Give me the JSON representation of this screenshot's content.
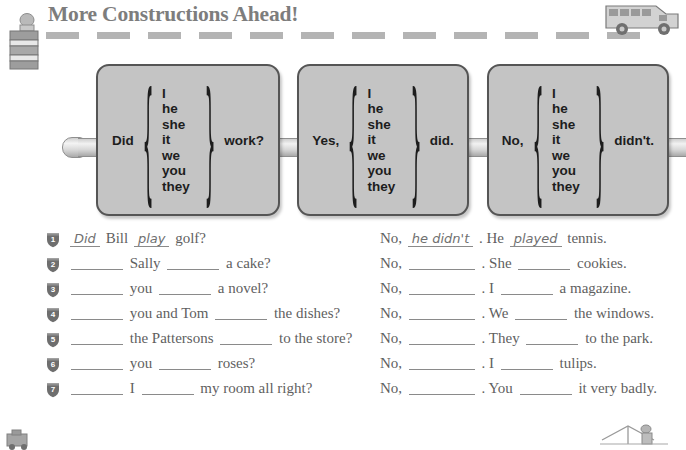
{
  "header": {
    "title": "More Constructions Ahead!",
    "barrel_icon": "construction-barrel-icon",
    "bus_icon": "school-bus-icon",
    "divider": "road-dash-divider",
    "dash_count": 12
  },
  "grammar_boxes": [
    {
      "lead": "Did",
      "pronouns": [
        "I",
        "he",
        "she",
        "it",
        "we",
        "you",
        "they"
      ],
      "tail": "work?"
    },
    {
      "lead": "Yes,",
      "pronouns": [
        "I",
        "he",
        "she",
        "it",
        "we",
        "you",
        "they"
      ],
      "tail": "did."
    },
    {
      "lead": "No,",
      "pronouns": [
        "I",
        "he",
        "she",
        "it",
        "we",
        "you",
        "they"
      ],
      "tail": "didn't."
    }
  ],
  "exercises": [
    {
      "number": "1",
      "left": [
        {
          "type": "answer",
          "text": "Did"
        },
        {
          "type": "text",
          "text": "Bill"
        },
        {
          "type": "answer",
          "text": "play"
        },
        {
          "type": "text",
          "text": "golf?"
        }
      ],
      "right": [
        {
          "type": "text",
          "text": "No,"
        },
        {
          "type": "answer",
          "text": "he didn't"
        },
        {
          "type": "text",
          "text": ". He"
        },
        {
          "type": "answer",
          "text": "played"
        },
        {
          "type": "text",
          "text": "tennis."
        }
      ]
    },
    {
      "number": "2",
      "left": [
        {
          "type": "blank",
          "size": "b-md"
        },
        {
          "type": "text",
          "text": "Sally"
        },
        {
          "type": "blank",
          "size": "b-md"
        },
        {
          "type": "text",
          "text": "a cake?"
        }
      ],
      "right": [
        {
          "type": "text",
          "text": "No,"
        },
        {
          "type": "blank",
          "size": "b-lg"
        },
        {
          "type": "text",
          "text": ". She"
        },
        {
          "type": "blank",
          "size": "b-md"
        },
        {
          "type": "text",
          "text": "cookies."
        }
      ]
    },
    {
      "number": "3",
      "left": [
        {
          "type": "blank",
          "size": "b-md"
        },
        {
          "type": "text",
          "text": "you"
        },
        {
          "type": "blank",
          "size": "b-md"
        },
        {
          "type": "text",
          "text": "a novel?"
        }
      ],
      "right": [
        {
          "type": "text",
          "text": "No,"
        },
        {
          "type": "blank",
          "size": "b-lg"
        },
        {
          "type": "text",
          "text": ". I"
        },
        {
          "type": "blank",
          "size": "b-md"
        },
        {
          "type": "text",
          "text": "a magazine."
        }
      ]
    },
    {
      "number": "4",
      "left": [
        {
          "type": "blank",
          "size": "b-md"
        },
        {
          "type": "text",
          "text": "you and Tom"
        },
        {
          "type": "blank",
          "size": "b-md"
        },
        {
          "type": "text",
          "text": "the dishes?"
        }
      ],
      "right": [
        {
          "type": "text",
          "text": "No,"
        },
        {
          "type": "blank",
          "size": "b-lg"
        },
        {
          "type": "text",
          "text": ". We"
        },
        {
          "type": "blank",
          "size": "b-md"
        },
        {
          "type": "text",
          "text": "the windows."
        }
      ]
    },
    {
      "number": "5",
      "left": [
        {
          "type": "blank",
          "size": "b-md"
        },
        {
          "type": "text",
          "text": "the Pattersons"
        },
        {
          "type": "blank",
          "size": "b-md"
        },
        {
          "type": "text",
          "text": "to the store?"
        }
      ],
      "right": [
        {
          "type": "text",
          "text": "No,"
        },
        {
          "type": "blank",
          "size": "b-lg"
        },
        {
          "type": "text",
          "text": ". They"
        },
        {
          "type": "blank",
          "size": "b-md"
        },
        {
          "type": "text",
          "text": "to the park."
        }
      ]
    },
    {
      "number": "6",
      "left": [
        {
          "type": "blank",
          "size": "b-md"
        },
        {
          "type": "text",
          "text": "you"
        },
        {
          "type": "blank",
          "size": "b-md"
        },
        {
          "type": "text",
          "text": "roses?"
        }
      ],
      "right": [
        {
          "type": "text",
          "text": "No,"
        },
        {
          "type": "blank",
          "size": "b-lg"
        },
        {
          "type": "text",
          "text": ". I"
        },
        {
          "type": "blank",
          "size": "b-md"
        },
        {
          "type": "text",
          "text": "tulips."
        }
      ]
    },
    {
      "number": "7",
      "left": [
        {
          "type": "blank",
          "size": "b-md"
        },
        {
          "type": "text",
          "text": "I"
        },
        {
          "type": "blank",
          "size": "b-md"
        },
        {
          "type": "text",
          "text": "my room all right?"
        }
      ],
      "right": [
        {
          "type": "text",
          "text": "No,"
        },
        {
          "type": "blank",
          "size": "b-lg"
        },
        {
          "type": "text",
          "text": ". You"
        },
        {
          "type": "blank",
          "size": "b-md"
        },
        {
          "type": "text",
          "text": "it very badly."
        }
      ]
    }
  ],
  "footer_icons": {
    "left": "construction-cone-icon",
    "right": "road-worker-icon"
  },
  "colors": {
    "title": "#7d7d7d",
    "box_fill": "#c4c4c4",
    "box_border": "#555555",
    "text": "#5f5f5f",
    "dash": "#b4b4b4",
    "shield": "#6e6e6e"
  }
}
